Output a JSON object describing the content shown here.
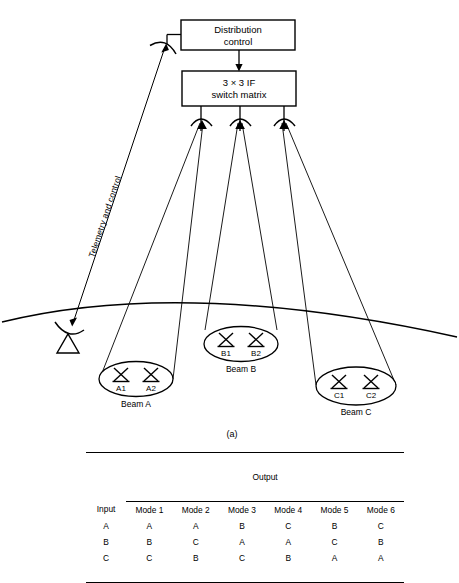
{
  "figure": {
    "caption": "(a)",
    "boxes": [
      {
        "id": "distribution-control",
        "line1": "Distribution",
        "line2": "control"
      },
      {
        "id": "switch-matrix",
        "line1": "3 × 3 IF",
        "line2": "switch matrix"
      }
    ],
    "telemetry_label": "Telemetry and control",
    "beams": [
      {
        "id": "beam-a",
        "label": "Beam A",
        "antennas": [
          "A1",
          "A2"
        ]
      },
      {
        "id": "beam-b",
        "label": "Beam B",
        "antennas": [
          "B1",
          "B2"
        ]
      },
      {
        "id": "beam-c",
        "label": "Beam C",
        "antennas": [
          "C1",
          "C2"
        ]
      }
    ]
  },
  "table": {
    "group_header": "Output",
    "input_header": "Input",
    "mode_headers": [
      "Mode 1",
      "Mode 2",
      "Mode 3",
      "Mode 4",
      "Mode 5",
      "Mode 6"
    ],
    "rows": [
      {
        "input": "A",
        "outputs": [
          "A",
          "A",
          "B",
          "C",
          "B",
          "C"
        ]
      },
      {
        "input": "B",
        "outputs": [
          "B",
          "C",
          "A",
          "A",
          "C",
          "B"
        ]
      },
      {
        "input": "C",
        "outputs": [
          "C",
          "B",
          "C",
          "B",
          "A",
          "A"
        ]
      }
    ]
  },
  "colors": {
    "ink": "#000000",
    "background": "#ffffff"
  }
}
